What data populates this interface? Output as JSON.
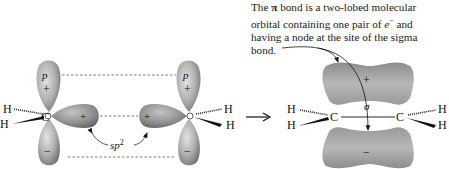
{
  "caption": {
    "line1_prefix": "The ",
    "line1_pi": "π",
    "line1_suffix": " bond is a two-lobed molecular",
    "line2_prefix": "orbital containing one pair of ",
    "line2_e": "e",
    "line2_sup": "−",
    "line2_suffix": " and",
    "line3": "having a node at the site of the sigma",
    "line4": "bond."
  },
  "left_molecule": {
    "left_carbon": {
      "atom": "C",
      "hydrogens": [
        "H",
        "H"
      ],
      "p_orbital_label": "p",
      "upper_lobe_sign": "+",
      "lower_lobe_sign": "−",
      "sp2_lobe_sign": "+"
    },
    "right_carbon": {
      "atom": "C",
      "hydrogens": [
        "H",
        "H"
      ],
      "p_orbital_label": "p",
      "upper_lobe_sign": "+",
      "lower_lobe_sign": "−",
      "sp2_lobe_sign": "+"
    },
    "hybrid_label": "sp",
    "hybrid_sup": "2"
  },
  "reaction_arrow": "→",
  "right_molecule": {
    "atoms": [
      "C",
      "C"
    ],
    "hydrogens": [
      "H",
      "H",
      "H",
      "H"
    ],
    "sigma_label": "σ",
    "upper_lobe_sign": "+",
    "lower_lobe_sign": "−"
  },
  "colors": {
    "lobe_light": "#c8c8c8",
    "lobe_dark": "#7a7a7a",
    "ink": "#111111"
  }
}
